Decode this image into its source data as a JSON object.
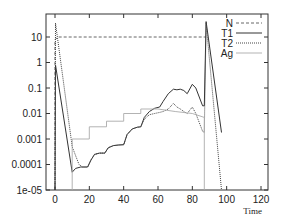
{
  "chart_data": {
    "type": "line",
    "title": "",
    "xlabel": "Time",
    "ylabel": "",
    "xlim": [
      -5,
      125
    ],
    "ylim": [
      1e-05,
      100
    ],
    "yscale": "log",
    "x_ticks": [
      0,
      20,
      40,
      60,
      80,
      100,
      120
    ],
    "y_ticks": [
      {
        "value": 1e-05,
        "label": "1e-05"
      },
      {
        "value": 0.0001,
        "label": "0.0001"
      },
      {
        "value": 0.001,
        "label": "0.001"
      },
      {
        "value": 0.01,
        "label": "0.01"
      },
      {
        "value": 0.1,
        "label": "0.1"
      },
      {
        "value": 1,
        "label": "1"
      },
      {
        "value": 10,
        "label": "10"
      }
    ],
    "grid": false,
    "legend_position": "top-right",
    "series": [
      {
        "name": "N",
        "style": "dashed",
        "color": "#555555",
        "points": [
          [
            0,
            1e-05
          ],
          [
            0,
            8
          ],
          [
            2,
            10
          ],
          [
            87,
            10
          ],
          [
            88,
            10
          ]
        ]
      },
      {
        "name": "T1",
        "style": "solid",
        "color": "#333333",
        "points": [
          [
            0,
            1e-05
          ],
          [
            0.3,
            0.8
          ],
          [
            10,
            5e-05
          ],
          [
            12,
            7e-05
          ],
          [
            15,
            8e-05
          ],
          [
            19,
            8e-05
          ],
          [
            21,
            0.00015
          ],
          [
            23,
            0.00025
          ],
          [
            26,
            0.00028
          ],
          [
            29,
            0.00028
          ],
          [
            31,
            0.00045
          ],
          [
            34,
            0.00055
          ],
          [
            37,
            0.00058
          ],
          [
            40,
            0.0006
          ],
          [
            42,
            0.0015
          ],
          [
            45,
            0.0025
          ],
          [
            48,
            0.0029
          ],
          [
            50,
            0.003
          ],
          [
            52,
            0.007
          ],
          [
            55,
            0.012
          ],
          [
            58,
            0.016
          ],
          [
            61,
            0.018
          ],
          [
            63,
            0.03
          ],
          [
            66,
            0.06
          ],
          [
            69,
            0.09
          ],
          [
            71,
            0.085
          ],
          [
            73,
            0.09
          ],
          [
            75,
            0.08
          ],
          [
            77,
            0.06
          ],
          [
            80,
            0.14
          ],
          [
            82,
            0.1
          ],
          [
            86,
            0.02
          ],
          [
            87,
            0.02
          ],
          [
            88,
            40
          ],
          [
            97,
            0.0018
          ]
        ]
      },
      {
        "name": "T2",
        "style": "dotted",
        "color": "#444444",
        "points": [
          [
            0,
            1e-05
          ],
          [
            0.3,
            35
          ],
          [
            10,
            0.0005
          ],
          [
            14,
            0.0001
          ],
          [
            16,
            8e-05
          ],
          [
            19,
            8e-05
          ],
          [
            21,
            0.00015
          ],
          [
            23,
            0.00025
          ],
          [
            26,
            0.00028
          ],
          [
            29,
            0.00028
          ],
          [
            31,
            0.00045
          ],
          [
            34,
            0.00055
          ],
          [
            37,
            0.00058
          ],
          [
            40,
            0.0006
          ],
          [
            42,
            0.0015
          ],
          [
            45,
            0.0025
          ],
          [
            48,
            0.0029
          ],
          [
            50,
            0.003
          ],
          [
            52,
            0.006
          ],
          [
            55,
            0.009
          ],
          [
            58,
            0.01
          ],
          [
            61,
            0.011
          ],
          [
            63,
            0.012
          ],
          [
            66,
            0.015
          ],
          [
            69,
            0.025
          ],
          [
            71,
            0.018
          ],
          [
            73,
            0.015
          ],
          [
            75,
            0.012
          ],
          [
            77,
            0.01
          ],
          [
            80,
            0.018
          ],
          [
            82,
            0.01
          ],
          [
            86,
            0.002
          ],
          [
            87,
            0.0018
          ],
          [
            88,
            35
          ],
          [
            97,
            1e-05
          ]
        ]
      },
      {
        "name": "Ag",
        "style": "solid-light",
        "color": "#aaaaaa",
        "points": [
          [
            10,
            1e-05
          ],
          [
            10,
            0.001
          ],
          [
            20,
            0.001
          ],
          [
            20,
            0.003
          ],
          [
            30,
            0.003
          ],
          [
            30,
            0.005
          ],
          [
            40,
            0.005
          ],
          [
            40,
            0.01
          ],
          [
            50,
            0.01
          ],
          [
            50,
            0.015
          ],
          [
            60,
            0.015
          ],
          [
            70,
            0.012
          ],
          [
            80,
            0.01
          ],
          [
            87,
            0.007
          ],
          [
            87,
            1e-05
          ]
        ]
      }
    ]
  }
}
